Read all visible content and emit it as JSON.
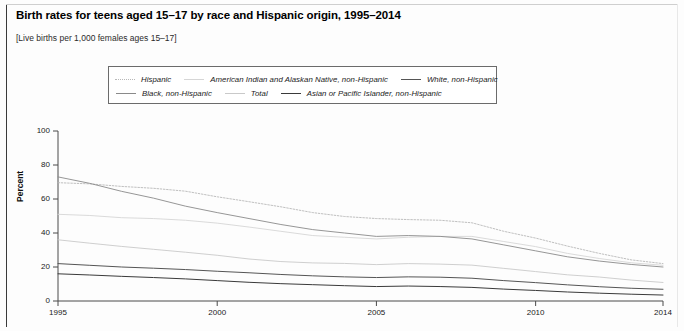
{
  "figure": {
    "title": "Birth rates for teens aged 15–17 by race and Hispanic origin, 1995–2014",
    "subtitle": "[Live births per 1,000 females ages 15–17]"
  },
  "legend": {
    "rows": [
      [
        {
          "label": "Hispanic",
          "color": "#b8b8b8",
          "style": "dotted"
        },
        {
          "label": "American Indian and Alaskan Native, non-Hispanic",
          "color": "#d6d6d6",
          "style": "solid"
        },
        {
          "label": "White, non-Hispanic",
          "color": "#555555",
          "style": "solid"
        }
      ],
      [
        {
          "label": "Black, non-Hispanic",
          "color": "#8a8a8a",
          "style": "solid"
        },
        {
          "label": "Total",
          "color": "#c9c9c9",
          "style": "solid"
        },
        {
          "label": "Asian or Pacific Islander, non-Hispanic",
          "color": "#3a3a3a",
          "style": "solid"
        }
      ]
    ]
  },
  "axes": {
    "ylabel": "Percent",
    "yticks": [
      0,
      20,
      40,
      60,
      80,
      100
    ],
    "xticks": [
      1995,
      2000,
      2005,
      2010,
      2014
    ]
  },
  "chart_data": {
    "type": "line",
    "title": "Birth rates for teens aged 15–17 by race and Hispanic origin, 1995–2014",
    "subtitle": "[Live births per 1,000 females ages 15–17]",
    "xlabel": "",
    "ylabel": "Percent",
    "xlim": [
      1995,
      2014
    ],
    "ylim": [
      0,
      100
    ],
    "grid": false,
    "legend_position": "top-inside",
    "x": [
      1995,
      1996,
      1997,
      1998,
      1999,
      2000,
      2001,
      2002,
      2003,
      2004,
      2005,
      2006,
      2007,
      2008,
      2009,
      2010,
      2011,
      2012,
      2013,
      2014
    ],
    "series": [
      {
        "name": "Hispanic",
        "color": "#b8b8b8",
        "style": "dotted",
        "values": [
          69.6,
          68.9,
          67.4,
          66.3,
          64.6,
          61.3,
          58.4,
          55.4,
          52.0,
          49.7,
          48.5,
          47.9,
          47.5,
          46.0,
          41.0,
          37.0,
          32.3,
          28.0,
          24.2,
          22.0
        ]
      },
      {
        "name": "American Indian and Alaskan Native, non-Hispanic",
        "color": "#d6d6d6",
        "style": "solid",
        "values": [
          51.0,
          50.3,
          49.0,
          48.5,
          47.5,
          45.8,
          43.5,
          41.0,
          38.5,
          37.5,
          36.5,
          37.5,
          38.0,
          38.0,
          35.0,
          32.0,
          28.0,
          25.0,
          22.5,
          21.0
        ]
      },
      {
        "name": "White, non-Hispanic",
        "color": "#555555",
        "style": "solid",
        "values": [
          22.0,
          21.0,
          20.0,
          19.3,
          18.5,
          17.5,
          16.6,
          15.6,
          14.8,
          14.2,
          13.8,
          14.2,
          14.0,
          13.4,
          12.0,
          10.8,
          9.5,
          8.4,
          7.5,
          6.9
        ]
      },
      {
        "name": "Black, non-Hispanic",
        "color": "#8a8a8a",
        "style": "solid",
        "values": [
          73.0,
          69.2,
          64.5,
          60.5,
          55.8,
          52.0,
          48.5,
          45.0,
          42.0,
          40.0,
          38.0,
          38.5,
          38.0,
          36.5,
          33.0,
          29.5,
          26.0,
          23.5,
          21.5,
          20.0
        ]
      },
      {
        "name": "Total",
        "color": "#c9c9c9",
        "style": "solid",
        "values": [
          36.0,
          34.0,
          32.1,
          30.4,
          28.7,
          26.9,
          24.7,
          23.2,
          22.4,
          22.1,
          21.4,
          22.0,
          21.7,
          21.1,
          19.2,
          17.3,
          15.4,
          14.1,
          12.3,
          10.9
        ]
      },
      {
        "name": "Asian or Pacific Islander, non-Hispanic",
        "color": "#3a3a3a",
        "style": "solid",
        "values": [
          16.0,
          15.3,
          14.5,
          13.8,
          13.0,
          12.0,
          11.0,
          10.2,
          9.6,
          9.0,
          8.5,
          8.8,
          8.5,
          8.0,
          7.0,
          6.2,
          5.3,
          4.6,
          4.0,
          3.5
        ]
      }
    ]
  }
}
